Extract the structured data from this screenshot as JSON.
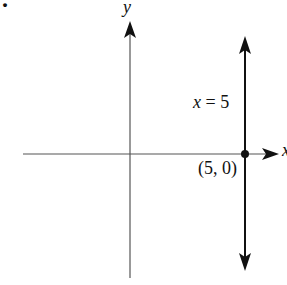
{
  "figure": {
    "marker": ".",
    "axes": {
      "x_label": "x",
      "y_label": "y"
    },
    "line": {
      "equation": "x = 5",
      "type": "vertical",
      "x_value": 5
    },
    "point": {
      "label": "(5, 0)",
      "x": 5,
      "y": 0
    },
    "colors": {
      "axis": "#555555",
      "line": "#111111"
    }
  }
}
